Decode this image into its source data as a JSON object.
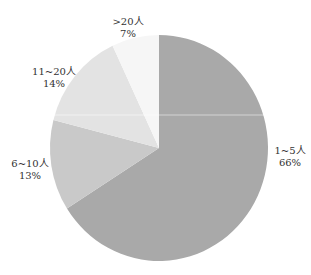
{
  "chart_data": {
    "type": "pie",
    "title": "",
    "categories": [
      "1~5人",
      "6~10人",
      "11~20人",
      ">20人"
    ],
    "values": [
      66,
      13,
      14,
      7
    ],
    "value_labels": [
      "66%",
      "13%",
      "14%",
      "7%"
    ],
    "colors": [
      "#a9a9a9",
      "#c9c9c9",
      "#e3e3e3",
      "#f6f6f6"
    ],
    "start_angle": "12 o'clock",
    "direction": "clockwise",
    "legend": "none (labels beside slices)"
  },
  "labels": [
    {
      "name": "1~5人",
      "pct": "66%"
    },
    {
      "name": "6~10人",
      "pct": "13%"
    },
    {
      "name": "11~20人",
      "pct": "14%"
    },
    {
      "name": ">20人",
      "pct": "7%"
    }
  ]
}
